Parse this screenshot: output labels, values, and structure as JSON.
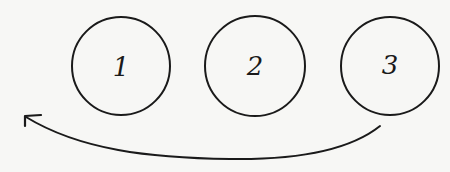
{
  "diagram": {
    "nodes": [
      {
        "id": "1",
        "label": "1",
        "cx": 121,
        "cy": 66,
        "r": 49
      },
      {
        "id": "2",
        "label": "2",
        "cx": 255,
        "cy": 66,
        "r": 50
      },
      {
        "id": "3",
        "label": "3",
        "cx": 390,
        "cy": 66,
        "r": 49
      }
    ],
    "edges": [
      {
        "from": "3",
        "to": "1",
        "style": "curved-arrow",
        "direction": "right-to-left"
      }
    ],
    "colors": {
      "background": "#f7f7f5",
      "stroke": "#1a1a1a"
    }
  }
}
